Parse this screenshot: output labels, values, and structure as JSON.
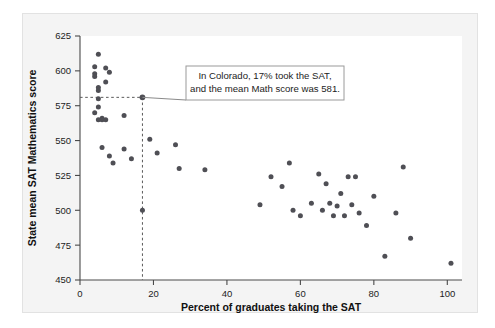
{
  "chart_data": {
    "type": "scatter",
    "title": "",
    "xlabel": "Percent of graduates taking the SAT",
    "ylabel": "State mean SAT Mathematics score",
    "xlim": [
      0,
      104
    ],
    "ylim": [
      450,
      625
    ],
    "xticks": [
      0,
      20,
      40,
      60,
      80,
      100
    ],
    "yticks": [
      450,
      475,
      500,
      525,
      550,
      575,
      600,
      625
    ],
    "xtick_labels": [
      "0",
      "20",
      "40",
      "60",
      "80",
      "100"
    ],
    "ytick_labels": [
      "450",
      "475",
      "500",
      "525",
      "550",
      "575",
      "600",
      "625"
    ],
    "grid": false,
    "legend": null,
    "marker_color": "#4f4f55",
    "points": [
      {
        "x": 4,
        "y": 603
      },
      {
        "x": 4,
        "y": 598
      },
      {
        "x": 4,
        "y": 596
      },
      {
        "x": 4,
        "y": 570
      },
      {
        "x": 5,
        "y": 565
      },
      {
        "x": 5,
        "y": 612
      },
      {
        "x": 5,
        "y": 588
      },
      {
        "x": 5,
        "y": 586
      },
      {
        "x": 5,
        "y": 580
      },
      {
        "x": 5,
        "y": 574
      },
      {
        "x": 6,
        "y": 566
      },
      {
        "x": 6,
        "y": 565
      },
      {
        "x": 7,
        "y": 565
      },
      {
        "x": 7,
        "y": 602
      },
      {
        "x": 7,
        "y": 592
      },
      {
        "x": 8,
        "y": 599
      },
      {
        "x": 6,
        "y": 545
      },
      {
        "x": 8,
        "y": 539
      },
      {
        "x": 9,
        "y": 534
      },
      {
        "x": 12,
        "y": 568
      },
      {
        "x": 12,
        "y": 544
      },
      {
        "x": 14,
        "y": 537
      },
      {
        "x": 17,
        "y": 581
      },
      {
        "x": 17,
        "y": 500
      },
      {
        "x": 19,
        "y": 551
      },
      {
        "x": 21,
        "y": 541
      },
      {
        "x": 26,
        "y": 547
      },
      {
        "x": 27,
        "y": 530
      },
      {
        "x": 34,
        "y": 529
      },
      {
        "x": 49,
        "y": 504
      },
      {
        "x": 52,
        "y": 524
      },
      {
        "x": 55,
        "y": 517
      },
      {
        "x": 57,
        "y": 534
      },
      {
        "x": 58,
        "y": 500
      },
      {
        "x": 60,
        "y": 496
      },
      {
        "x": 63,
        "y": 505
      },
      {
        "x": 65,
        "y": 526
      },
      {
        "x": 66,
        "y": 500
      },
      {
        "x": 67,
        "y": 519
      },
      {
        "x": 68,
        "y": 505
      },
      {
        "x": 69,
        "y": 496
      },
      {
        "x": 70,
        "y": 503
      },
      {
        "x": 71,
        "y": 512
      },
      {
        "x": 72,
        "y": 496
      },
      {
        "x": 73,
        "y": 524
      },
      {
        "x": 74,
        "y": 504
      },
      {
        "x": 75,
        "y": 524
      },
      {
        "x": 76,
        "y": 498
      },
      {
        "x": 78,
        "y": 489
      },
      {
        "x": 80,
        "y": 510
      },
      {
        "x": 83,
        "y": 467
      },
      {
        "x": 86,
        "y": 498
      },
      {
        "x": 88,
        "y": 531
      },
      {
        "x": 90,
        "y": 480
      },
      {
        "x": 101,
        "y": 462
      }
    ],
    "highlight": {
      "label": "Colorado",
      "x": 17,
      "y": 581,
      "guide_lines": true
    },
    "annotation": {
      "line1": "In Colorado, 17% took the SAT,",
      "line2": "and the mean Math score was 581."
    }
  }
}
